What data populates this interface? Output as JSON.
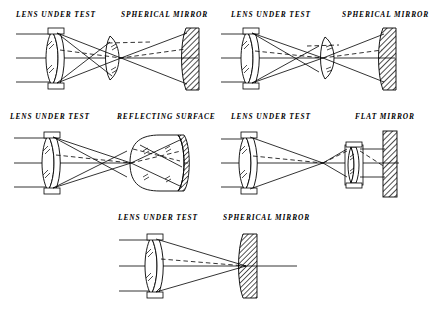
{
  "figure": {
    "background_color": "#ffffff",
    "line_color": "#000000",
    "width": 438,
    "height": 311
  },
  "panels": [
    {
      "id": "panel-1",
      "position": "top-left",
      "left_label": "LENS UNDER TEST",
      "right_label": "SPHERICAL MIRROR",
      "components": [
        "doublet-lens",
        "biconvex-lens",
        "concave-spherical-mirror"
      ],
      "ray_types": [
        "solid-marginal-ray",
        "dashed-offset-ray",
        "optical-axis"
      ]
    },
    {
      "id": "panel-2",
      "position": "top-right",
      "left_label": "LENS UNDER TEST",
      "right_label": "SPHERICAL MIRROR",
      "components": [
        "doublet-lens",
        "convex-right-lens",
        "concave-spherical-mirror"
      ],
      "ray_types": [
        "solid-marginal-ray",
        "dashed-offset-ray",
        "optical-axis"
      ]
    },
    {
      "id": "panel-3",
      "position": "middle-left",
      "left_label": "LENS UNDER TEST",
      "right_label": "REFLECTING SURFACE",
      "components": [
        "doublet-lens",
        "thick-plano-convex-reflector"
      ],
      "ray_types": [
        "solid-marginal-ray",
        "dashed-offset-ray",
        "optical-axis"
      ]
    },
    {
      "id": "panel-4",
      "position": "middle-right",
      "left_label": "LENS UNDER TEST",
      "right_label": "FLAT MIRROR",
      "components": [
        "doublet-lens",
        "small-collimating-doublet",
        "flat-mirror-bar"
      ],
      "ray_types": [
        "solid-marginal-ray",
        "dashed-offset-ray",
        "optical-axis"
      ]
    },
    {
      "id": "panel-5",
      "position": "bottom-center",
      "left_label": "LENS UNDER TEST",
      "right_label": "SPHERICAL MIRROR",
      "components": [
        "doublet-lens",
        "concave-spherical-mirror"
      ],
      "ray_types": [
        "solid-marginal-ray",
        "dashed-offset-ray",
        "optical-axis"
      ]
    }
  ]
}
